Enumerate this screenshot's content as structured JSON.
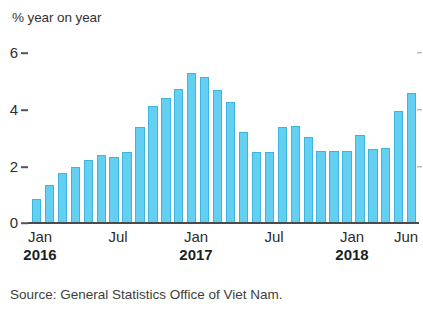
{
  "chart_data": {
    "type": "bar",
    "title": "",
    "subtitle": "",
    "ylabel": "% year on year",
    "xlabel": "",
    "ylim": [
      0,
      6
    ],
    "yticks": [
      0,
      2,
      4,
      6
    ],
    "ytick_labels": [
      "0",
      "2",
      "4",
      "6"
    ],
    "grid": false,
    "legend": null,
    "categories": [
      "Jan 2016",
      "Feb 2016",
      "Mar 2016",
      "Apr 2016",
      "May 2016",
      "Jun 2016",
      "Jul 2016",
      "Aug 2016",
      "Sep 2016",
      "Oct 2016",
      "Nov 2016",
      "Dec 2016",
      "Jan 2017",
      "Feb 2017",
      "Mar 2017",
      "Apr 2017",
      "May 2017",
      "Jun 2017",
      "Jul 2017",
      "Aug 2017",
      "Sep 2017",
      "Oct 2017",
      "Nov 2017",
      "Dec 2017",
      "Jan 2018",
      "Feb 2018",
      "Mar 2018",
      "Apr 2018",
      "May 2018",
      "Jun 2018"
    ],
    "values": [
      0.8,
      1.3,
      1.7,
      1.9,
      2.15,
      2.3,
      2.25,
      2.4,
      3.25,
      3.95,
      4.25,
      4.55,
      5.1,
      4.95,
      4.5,
      4.1,
      3.1,
      2.4,
      2.4,
      3.25,
      3.3,
      2.9,
      2.45,
      2.45,
      2.45,
      3.0,
      2.5,
      2.55,
      3.8,
      4.4
    ],
    "bar_color": "#63d0f2",
    "bar_edge_color": "#3fb4dd",
    "axis_color": "#4a4a4a"
  },
  "axis": {
    "y_title": "% year on year",
    "y_ticks": [
      {
        "label": "6",
        "value": 6
      },
      {
        "label": "4",
        "value": 4
      },
      {
        "label": "2",
        "value": 2
      },
      {
        "label": "0",
        "value": 0
      }
    ],
    "x_ticks": [
      {
        "month": "Jan",
        "year": "2016"
      },
      {
        "month": "Jul",
        "year": ""
      },
      {
        "month": "Jan",
        "year": "2017"
      },
      {
        "month": "Jul",
        "year": ""
      },
      {
        "month": "Jan",
        "year": "2018"
      },
      {
        "month": "Jun",
        "year": ""
      }
    ]
  },
  "footer": {
    "source": "Source: General Statistics Office of Viet Nam."
  }
}
